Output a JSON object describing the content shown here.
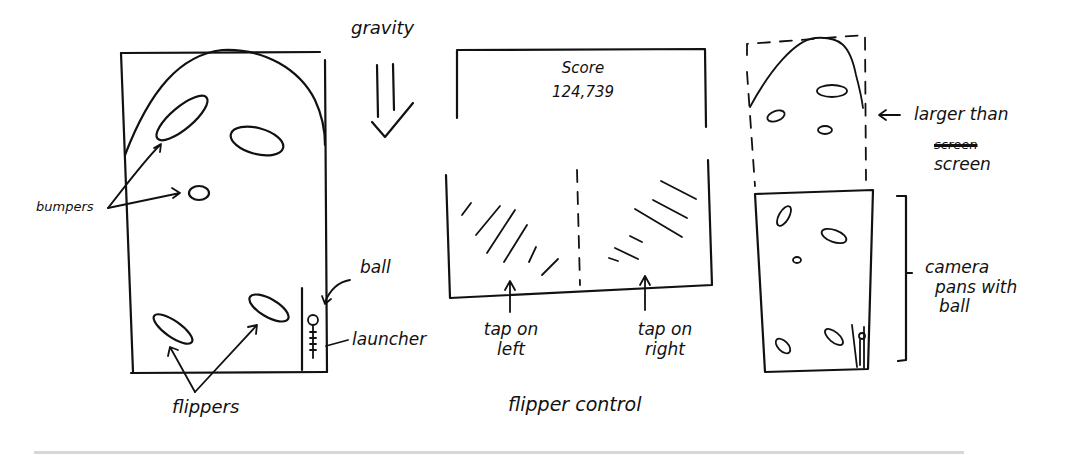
{
  "panels": {
    "table": {
      "labels": {
        "gravity": "gravity",
        "bumpers": "bumpers",
        "ball": "ball",
        "launcher": "launcher",
        "flippers": "flippers"
      }
    },
    "controls": {
      "score_title": "Score",
      "score_value": "124,739",
      "tap_left": [
        "tap on",
        "left"
      ],
      "tap_right": [
        "tap on",
        "right"
      ],
      "caption": "flipper control"
    },
    "camera": {
      "larger_than": "larger than",
      "struck_word": "screen",
      "screen": "screen",
      "camera_pans": [
        "camera",
        "pans with",
        "ball"
      ]
    }
  },
  "colors": {
    "ink": "#111111",
    "background": "#ffffff",
    "rule": "#d7d7d7"
  }
}
